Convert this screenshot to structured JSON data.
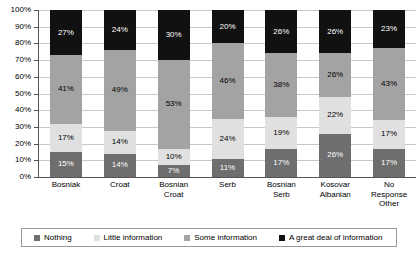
{
  "chart_data": {
    "type": "bar",
    "subtype": "stacked-bar-100-percent",
    "title": "",
    "xlabel": "",
    "ylabel": "",
    "ylim": [
      0,
      100
    ],
    "ytick_labels": [
      "100%",
      "90%",
      "80%",
      "70%",
      "60%",
      "50%",
      "40%",
      "30%",
      "20%",
      "10%",
      "0%"
    ],
    "ytick_values": [
      100,
      90,
      80,
      70,
      60,
      50,
      40,
      30,
      20,
      10,
      0
    ],
    "grid": true,
    "grid_axis": "y",
    "legend_position": "bottom",
    "value_labels": true,
    "value_label_suffix": "%",
    "categories": [
      "Bosniak",
      "Croat",
      "Bosnian Croat",
      "Serb",
      "Bosnian Serb",
      "Kosovar Albanian",
      "No Response Other"
    ],
    "category_lines": [
      [
        "Bosniak"
      ],
      [
        "Croat"
      ],
      [
        "Bosnian",
        "Croat"
      ],
      [
        "Serb"
      ],
      [
        "Bosnian",
        "Serb"
      ],
      [
        "Kosovar",
        "Albanian"
      ],
      [
        "No",
        "Response",
        "Other"
      ]
    ],
    "series": [
      {
        "name": "Nothing",
        "color": "#6e6e6e",
        "label_color": "#ffffff",
        "values": [
          15,
          14,
          7,
          11,
          17,
          26,
          17
        ]
      },
      {
        "name": "Little information",
        "color": "#e0e0e0",
        "label_color": "#000000",
        "values": [
          17,
          14,
          10,
          24,
          19,
          22,
          17
        ]
      },
      {
        "name": "Some information",
        "color": "#a3a3a3",
        "label_color": "#000000",
        "values": [
          41,
          49,
          53,
          46,
          38,
          26,
          43
        ]
      },
      {
        "name": "A great deal of information",
        "color": "#111111",
        "label_color": "#ffffff",
        "values": [
          27,
          24,
          30,
          20,
          26,
          26,
          23
        ]
      }
    ]
  },
  "legend": {
    "items": [
      {
        "label": "Nothing",
        "color": "#6e6e6e"
      },
      {
        "label": "Little information",
        "color": "#e0e0e0"
      },
      {
        "label": "Some information",
        "color": "#a3a3a3"
      },
      {
        "label": "A great deal of information",
        "color": "#111111"
      }
    ]
  },
  "colors": {
    "background": "#ffffff",
    "axis": "#555555",
    "gridline": "#c8c8c8",
    "legend_border": "#9a9a9a",
    "text": "#000000"
  }
}
